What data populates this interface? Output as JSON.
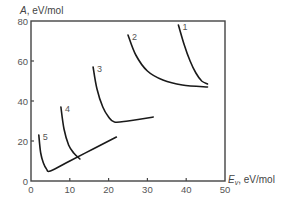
{
  "chart_data": {
    "type": "line",
    "title": "",
    "xlabel": "E_v, eV/mol",
    "xlabel_main": "E",
    "xlabel_sub": "v",
    "xlabel_unit": ", eV/mol",
    "ylabel": "A, eV/mol",
    "ylabel_main": "A",
    "ylabel_unit": ", eV/mol",
    "xlim": [
      0,
      50
    ],
    "ylim": [
      0,
      80
    ],
    "x_ticks": [
      "0",
      "10",
      "20",
      "30",
      "40",
      "50"
    ],
    "y_ticks": [
      "0",
      "20",
      "40",
      "60",
      "80"
    ],
    "grid": false,
    "legend": "inline curve labels",
    "series": [
      {
        "name": "1",
        "label": "1",
        "x": [
          38.0,
          39.5,
          41.0,
          42.5,
          44.0,
          45.5
        ],
        "y": [
          78,
          68,
          60,
          54,
          50,
          48.5
        ]
      },
      {
        "name": "2",
        "label": "2",
        "x": [
          25.0,
          27.0,
          30.0,
          34.0,
          39.0,
          45.5
        ],
        "y": [
          73,
          63,
          55,
          50.5,
          48,
          47
        ]
      },
      {
        "name": "3",
        "label": "3",
        "x": [
          16.0,
          17.0,
          18.5,
          20.0,
          21.5,
          25.0,
          31.5
        ],
        "y": [
          57,
          46,
          37,
          32,
          29.5,
          30,
          32
        ]
      },
      {
        "name": "4",
        "label": "4",
        "x": [
          7.7,
          8.5,
          9.7,
          11.0,
          12.6
        ],
        "y": [
          37,
          26,
          18,
          14,
          11
        ]
      },
      {
        "name": "5",
        "label": "5",
        "x": [
          2.0,
          2.5,
          3.2,
          4.0,
          5.0,
          10.0,
          16.0,
          22.0
        ],
        "y": [
          23,
          14,
          9,
          6,
          5,
          10,
          16,
          22
        ]
      }
    ]
  }
}
